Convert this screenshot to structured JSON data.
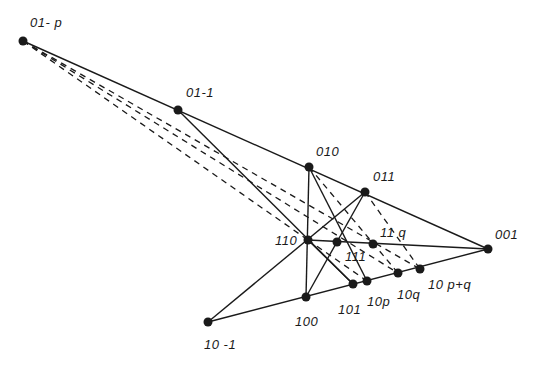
{
  "diagram": {
    "type": "projective-point-line-configuration",
    "points": [
      {
        "id": "01-p",
        "label": "01- p",
        "x": 23,
        "y": 41,
        "lx": 30,
        "ly": 16
      },
      {
        "id": "01-1",
        "label": "01-1",
        "x": 178,
        "y": 110,
        "lx": 186,
        "ly": 86
      },
      {
        "id": "010",
        "label": "010",
        "x": 309,
        "y": 167,
        "lx": 316,
        "ly": 145
      },
      {
        "id": "011",
        "label": "011",
        "x": 365,
        "y": 192,
        "lx": 373,
        "ly": 170
      },
      {
        "id": "110",
        "label": "110",
        "x": 308,
        "y": 240,
        "lx": 275,
        "ly": 234
      },
      {
        "id": "111",
        "label": "111",
        "x": 337,
        "y": 242,
        "lx": 345,
        "ly": 250
      },
      {
        "id": "11q",
        "label": "11 q",
        "x": 373,
        "y": 244,
        "lx": 380,
        "ly": 226
      },
      {
        "id": "001",
        "label": "001",
        "x": 488,
        "y": 249,
        "lx": 495,
        "ly": 228
      },
      {
        "id": "101",
        "label": "101",
        "x": 353,
        "y": 284,
        "lx": 338,
        "ly": 303
      },
      {
        "id": "10p",
        "label": "10p",
        "x": 367,
        "y": 281,
        "lx": 367,
        "ly": 295
      },
      {
        "id": "10q",
        "label": "10q",
        "x": 398,
        "y": 273,
        "lx": 397,
        "ly": 288
      },
      {
        "id": "10p+q",
        "label": "10 p+q",
        "x": 420,
        "y": 269,
        "lx": 428,
        "ly": 278
      },
      {
        "id": "100",
        "label": "100",
        "x": 306,
        "y": 297,
        "lx": 295,
        "ly": 315
      },
      {
        "id": "10-1",
        "label": "10 -1",
        "x": 208,
        "y": 322,
        "lx": 204,
        "ly": 338
      }
    ],
    "solid_lines": [
      [
        "01-p",
        "001"
      ],
      [
        "01-1",
        "101"
      ],
      [
        "010",
        "100"
      ],
      [
        "010",
        "10p"
      ],
      [
        "011",
        "100"
      ],
      [
        "011",
        "10-1"
      ],
      [
        "110",
        "001"
      ],
      [
        "10-1",
        "001"
      ],
      [
        "110",
        "101"
      ]
    ],
    "dashed_lines": [
      [
        "01-p",
        "110"
      ],
      [
        "01-p",
        "10p+q"
      ],
      [
        "01-p",
        "10q"
      ],
      [
        "010",
        "10q"
      ],
      [
        "011",
        "10p+q"
      ],
      [
        "110",
        "10p"
      ]
    ],
    "colors": {
      "ink": "#1a1a1a",
      "background": "#ffffff"
    }
  }
}
